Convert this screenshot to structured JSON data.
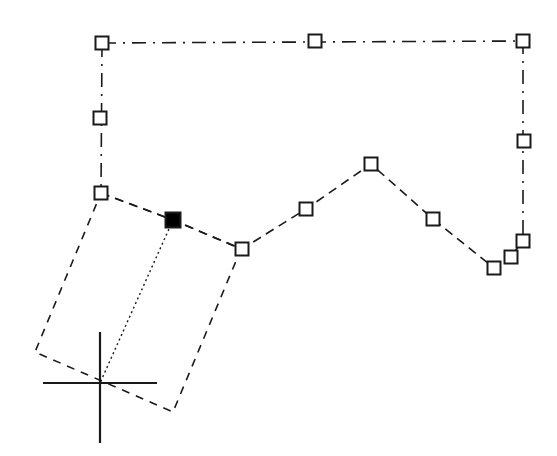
{
  "app": {
    "title": "CAD Drawing Area",
    "background_color": "#ffffff",
    "entity_color": "#1a1a1a",
    "grip_fill_color": "#ffffff",
    "grip_stroke_color": "#1a1a1a",
    "hot_grip_fill_color": "#000000"
  },
  "canvas": {
    "width": 557,
    "height": 456,
    "name": "drawing-canvas"
  },
  "ucs_icon": {
    "name": "ucs-crosshair-icon",
    "center_x": 100,
    "center_y": 383,
    "h_x1": 43,
    "h_x2": 157,
    "v_y1": 332,
    "v_y2": 443,
    "stroke_width": 2.2
  },
  "entities": [
    {
      "name": "selected-polyline-upper",
      "kind": "polyline",
      "linetype": "dash-dot",
      "stroke_width": 1.6,
      "dash_pattern": "14,7,2,7",
      "points": [
        [
          102,
          43
        ],
        [
          523,
          41
        ],
        [
          523,
          241
        ]
      ]
    },
    {
      "name": "selected-polyline-left-edge",
      "kind": "polyline",
      "linetype": "dash-dot",
      "stroke_width": 1.6,
      "dash_pattern": "14,7,2,7",
      "points": [
        [
          102,
          43
        ],
        [
          101,
          193
        ]
      ]
    },
    {
      "name": "selected-polyline-lower-chain",
      "kind": "polyline",
      "linetype": "dashed",
      "stroke_width": 1.6,
      "dash_pattern": "9,6",
      "points": [
        [
          101,
          193
        ],
        [
          173,
          220
        ],
        [
          242,
          249
        ],
        [
          306,
          209
        ],
        [
          371,
          164
        ],
        [
          433,
          219
        ],
        [
          494,
          268
        ],
        [
          511,
          256
        ],
        [
          523,
          241
        ]
      ]
    },
    {
      "name": "rotated-rectangle",
      "kind": "closed-polygon",
      "linetype": "dashed",
      "stroke_width": 1.6,
      "dash_pattern": "8,7",
      "points": [
        [
          101,
          193
        ],
        [
          173,
          220
        ],
        [
          241,
          249
        ],
        [
          173,
          412
        ],
        [
          35,
          352
        ]
      ]
    },
    {
      "name": "rectangle-diagonal",
      "kind": "line",
      "linetype": "dotted",
      "stroke_width": 1.4,
      "dash_pattern": "2,3",
      "points": [
        [
          173,
          220
        ],
        [
          100,
          383
        ]
      ]
    }
  ],
  "grips": [
    {
      "name": "grip-top-left-corner",
      "x": 102,
      "y": 43,
      "state": "warm",
      "size": 13
    },
    {
      "name": "grip-top-mid",
      "x": 315,
      "y": 41,
      "state": "warm",
      "size": 13
    },
    {
      "name": "grip-top-right-corner",
      "x": 523,
      "y": 41,
      "state": "warm",
      "size": 13
    },
    {
      "name": "grip-left-mid",
      "x": 100,
      "y": 118,
      "state": "warm",
      "size": 13
    },
    {
      "name": "grip-left-lower",
      "x": 101,
      "y": 193,
      "state": "warm",
      "size": 13
    },
    {
      "name": "grip-right-mid",
      "x": 524,
      "y": 141,
      "state": "warm",
      "size": 13
    },
    {
      "name": "grip-right-lower",
      "x": 523,
      "y": 241,
      "state": "warm",
      "size": 13
    },
    {
      "name": "grip-bottom-right-inner",
      "x": 511,
      "y": 257,
      "state": "warm",
      "size": 13
    },
    {
      "name": "grip-bottom-right-outer",
      "x": 494,
      "y": 268,
      "state": "warm",
      "size": 13
    },
    {
      "name": "grip-valley-mid",
      "x": 242,
      "y": 249,
      "state": "warm",
      "size": 13
    },
    {
      "name": "grip-rise-mid",
      "x": 306,
      "y": 209,
      "state": "warm",
      "size": 13
    },
    {
      "name": "grip-peak",
      "x": 371,
      "y": 164,
      "state": "warm",
      "size": 13
    },
    {
      "name": "grip-descent-mid",
      "x": 433,
      "y": 219,
      "state": "warm",
      "size": 13
    },
    {
      "name": "grip-hot-selected",
      "x": 173,
      "y": 220,
      "state": "hot",
      "size": 15
    }
  ]
}
